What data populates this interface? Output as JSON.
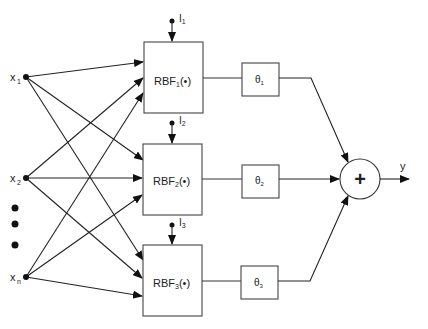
{
  "diagram": {
    "type": "RBF neural network",
    "inputs": [
      {
        "id": "x1",
        "label": "x",
        "sub": "1"
      },
      {
        "id": "x2",
        "label": "x",
        "sub": "2"
      },
      {
        "id": "xn",
        "label": "x",
        "sub": "n"
      }
    ],
    "ellipsis_dots": 3,
    "rbf_units": [
      {
        "label": "RBF",
        "sub": "1",
        "arg": "(•)",
        "bias_label": "I",
        "bias_sub": "1"
      },
      {
        "label": "RBF",
        "sub": "2",
        "arg": "(•)",
        "bias_label": "I",
        "bias_sub": "2"
      },
      {
        "label": "RBF",
        "sub": "3",
        "arg": "(•)",
        "bias_label": "I",
        "bias_sub": "3"
      }
    ],
    "weights": [
      {
        "label": "θ",
        "sub": "1"
      },
      {
        "label": "θ",
        "sub": "2"
      },
      {
        "label": "θ",
        "sub": "3"
      }
    ],
    "summation": {
      "symbol": "+"
    },
    "output": {
      "label": "y"
    },
    "colors": {
      "stroke": "#222222",
      "box_stroke": "#444444",
      "background": "#ffffff"
    }
  }
}
